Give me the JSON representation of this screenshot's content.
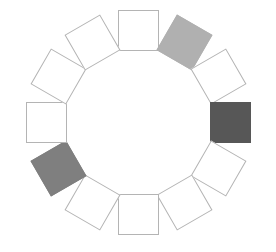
{
  "figure": {
    "width": 276,
    "height": 252,
    "background_color": "#ffffff",
    "center_x": 138,
    "center_y": 122,
    "ring_radius": 92,
    "square_size": 41,
    "count": 12
  },
  "palette": {
    "white_fill": "#ffffff",
    "outline": "#b4b4b4",
    "light_gray_fill": "#b0b0b0",
    "medium_gray_fill": "#7f7f7f",
    "dark_gray_fill": "#575757"
  },
  "chart_data": {
    "type": "scatter",
    "subtitle": "",
    "xlabel": "",
    "ylabel": "",
    "xlim": [
      0,
      276
    ],
    "ylim": [
      0,
      252
    ],
    "grid": false,
    "legend": "none",
    "categories": [
      "12 o'clock",
      "1 o'clock",
      "2 o'clock",
      "3 o'clock",
      "4 o'clock",
      "5 o'clock",
      "6 o'clock",
      "7 o'clock",
      "8 o'clock",
      "9 o'clock",
      "10 o'clock",
      "11 o'clock"
    ],
    "values": [
      0,
      1,
      0,
      2,
      0,
      0,
      0,
      0,
      3,
      0,
      0,
      0
    ],
    "value_legend": {
      "0": "unfilled / white",
      "1": "light gray",
      "2": "dark gray",
      "3": "medium gray"
    },
    "series": [
      {
        "name": "squares",
        "values": [
          0,
          1,
          0,
          2,
          0,
          0,
          0,
          0,
          3,
          0,
          0,
          0
        ]
      }
    ]
  },
  "nodes": [
    {
      "id": "square-01",
      "label": "12 o'clock",
      "angle_deg": 0,
      "rotation_deg": 0,
      "cx": 138,
      "cy": 30,
      "size": 41,
      "fill": "#ffffff",
      "stroke": "#b4b4b4",
      "filled": false,
      "shade": "white"
    },
    {
      "id": "square-02",
      "label": "1 o'clock",
      "angle_deg": 30,
      "rotation_deg": 30,
      "cx": 184,
      "cy": 42,
      "size": 41,
      "fill": "#b0b0b0",
      "stroke": "#b0b0b0",
      "filled": true,
      "shade": "light-gray"
    },
    {
      "id": "square-03",
      "label": "2 o'clock",
      "angle_deg": 60,
      "rotation_deg": 60,
      "cx": 218,
      "cy": 76,
      "size": 41,
      "fill": "#ffffff",
      "stroke": "#b4b4b4",
      "filled": false,
      "shade": "white"
    },
    {
      "id": "square-04",
      "label": "3 o'clock",
      "angle_deg": 90,
      "rotation_deg": 90,
      "cx": 230,
      "cy": 122,
      "size": 41,
      "fill": "#575757",
      "stroke": "#575757",
      "filled": true,
      "shade": "dark-gray"
    },
    {
      "id": "square-05",
      "label": "4 o'clock",
      "angle_deg": 120,
      "rotation_deg": 120,
      "cx": 218,
      "cy": 168,
      "size": 41,
      "fill": "#ffffff",
      "stroke": "#b4b4b4",
      "filled": false,
      "shade": "white"
    },
    {
      "id": "square-06",
      "label": "5 o'clock",
      "angle_deg": 150,
      "rotation_deg": 150,
      "cx": 184,
      "cy": 202,
      "size": 41,
      "fill": "#ffffff",
      "stroke": "#b4b4b4",
      "filled": false,
      "shade": "white"
    },
    {
      "id": "square-07",
      "label": "6 o'clock",
      "angle_deg": 180,
      "rotation_deg": 180,
      "cx": 138,
      "cy": 214,
      "size": 41,
      "fill": "#ffffff",
      "stroke": "#b4b4b4",
      "filled": false,
      "shade": "white"
    },
    {
      "id": "square-08",
      "label": "7 o'clock",
      "angle_deg": 210,
      "rotation_deg": 210,
      "cx": 92,
      "cy": 202,
      "size": 41,
      "fill": "#ffffff",
      "stroke": "#b4b4b4",
      "filled": false,
      "shade": "white"
    },
    {
      "id": "square-09",
      "label": "8 o'clock",
      "angle_deg": 240,
      "rotation_deg": 240,
      "cx": 58,
      "cy": 168,
      "size": 41,
      "fill": "#7f7f7f",
      "stroke": "#7f7f7f",
      "filled": true,
      "shade": "medium-gray"
    },
    {
      "id": "square-10",
      "label": "9 o'clock",
      "angle_deg": 270,
      "rotation_deg": 270,
      "cx": 46,
      "cy": 122,
      "size": 41,
      "fill": "#ffffff",
      "stroke": "#b4b4b4",
      "filled": false,
      "shade": "white"
    },
    {
      "id": "square-11",
      "label": "10 o'clock",
      "angle_deg": 300,
      "rotation_deg": 300,
      "cx": 58,
      "cy": 76,
      "size": 41,
      "fill": "#ffffff",
      "stroke": "#b4b4b4",
      "filled": false,
      "shade": "white"
    },
    {
      "id": "square-12",
      "label": "11 o'clock",
      "angle_deg": 330,
      "rotation_deg": 330,
      "cx": 92,
      "cy": 42,
      "size": 41,
      "fill": "#ffffff",
      "stroke": "#b4b4b4",
      "filled": false,
      "shade": "white"
    }
  ]
}
